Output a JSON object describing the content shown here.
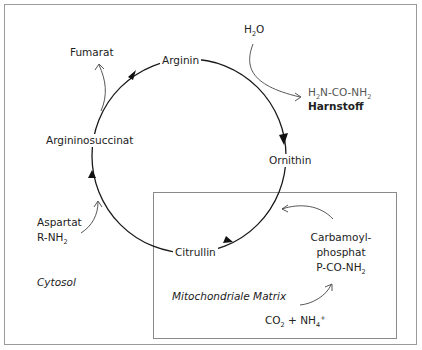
{
  "diagram": {
    "compartments": {
      "cytosol": "Cytosol",
      "mitochondria": "Mitochondriale Matrix"
    },
    "cycle_nodes": [
      {
        "id": "arginin",
        "label": "Arginin"
      },
      {
        "id": "ornithin",
        "label": "Ornithin"
      },
      {
        "id": "citrullin",
        "label": "Citrullin"
      },
      {
        "id": "argininosuccinat",
        "label": "Argininosuccinat"
      }
    ],
    "inputs_outputs": {
      "fumarat": "Fumarat",
      "water": {
        "main": "H",
        "sub": "2",
        "tail": "O"
      },
      "urea_formula": {
        "p1": "H",
        "s1": "2",
        "p2": "N-CO-NH",
        "s2": "2"
      },
      "urea_name": "Harnstoff",
      "aspartat": "Aspartat",
      "r_nh2": {
        "main": "R-NH",
        "sub": "2"
      },
      "carbamoyl_line1": "Carbamoyl-",
      "carbamoyl_line2": "phosphat",
      "carbamoyl_formula": {
        "main": "P-CO-NH",
        "sub": "2"
      },
      "co2_nh4": {
        "p1": "CO",
        "s1": "2",
        "p2": " + NH",
        "s2": "4",
        "sup": "+"
      }
    },
    "edges": [
      {
        "from": "Argininosuccinat",
        "to": "Arginin",
        "type": "cycle"
      },
      {
        "from": "Arginin",
        "to": "Ornithin",
        "type": "cycle"
      },
      {
        "from": "Ornithin",
        "to": "Citrullin",
        "type": "cycle"
      },
      {
        "from": "Citrullin",
        "to": "Argininosuccinat",
        "type": "cycle"
      },
      {
        "from": "Argininosuccinat",
        "to": "Fumarat",
        "type": "side-output"
      },
      {
        "from": "H2O",
        "to": "Harnstoff",
        "type": "side-input-output"
      },
      {
        "from": "Aspartat",
        "to": "Argininosuccinat",
        "type": "side-input"
      },
      {
        "from": "Carbamoylphosphat",
        "to": "Citrullin",
        "type": "side-input"
      },
      {
        "from": "CO2 + NH4+",
        "to": "Carbamoylphosphat",
        "type": "side-input"
      }
    ],
    "colors": {
      "line": "#1a1a1a",
      "side_arrow": "#444444",
      "frame": "#9a9a9a",
      "text": "#222222"
    }
  }
}
